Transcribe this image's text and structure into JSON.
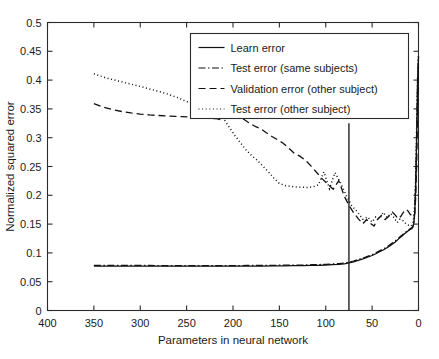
{
  "chart_data": {
    "type": "line",
    "title": "",
    "xlabel": "Parameters in neural network",
    "ylabel": "Normalized squared error",
    "xlim": [
      400,
      0
    ],
    "ylim": [
      0,
      0.5
    ],
    "x_reversed": true,
    "grid": false,
    "legend_position": "top-right",
    "xticks": [
      400,
      350,
      300,
      250,
      200,
      150,
      100,
      50,
      0
    ],
    "yticks": [
      0,
      0.05,
      0.1,
      0.15,
      0.2,
      0.25,
      0.3,
      0.35,
      0.4,
      0.45,
      0.5
    ],
    "xtick_labels": [
      "400",
      "350",
      "300",
      "250",
      "200",
      "150",
      "100",
      "50",
      "0"
    ],
    "ytick_labels": [
      "0",
      "0.05",
      "0.1",
      "0.15",
      "0.2",
      "0.25",
      "0.3",
      "0.35",
      "0.4",
      "0.45",
      "0.5"
    ],
    "annotations": [
      {
        "type": "vertical-line",
        "name": "selected-model-marker",
        "x": 75,
        "y_from": 0,
        "y_to": 0.325
      }
    ],
    "series": [
      {
        "name": "Learn error",
        "style": "solid",
        "x": [
          350,
          330,
          310,
          290,
          270,
          250,
          230,
          215,
          200,
          185,
          170,
          155,
          145,
          135,
          125,
          115,
          108,
          100,
          93,
          86,
          80,
          75,
          70,
          65,
          60,
          55,
          50,
          46,
          42,
          38,
          34,
          31,
          28,
          25,
          22,
          20,
          18,
          16,
          14,
          12,
          11,
          10,
          9,
          8,
          7,
          6,
          5,
          4,
          3,
          2,
          1,
          0
        ],
        "values": [
          0.077,
          0.077,
          0.077,
          0.077,
          0.077,
          0.077,
          0.077,
          0.077,
          0.077,
          0.0772,
          0.0772,
          0.0775,
          0.0775,
          0.078,
          0.078,
          0.0785,
          0.0785,
          0.079,
          0.0795,
          0.08,
          0.081,
          0.0825,
          0.0845,
          0.087,
          0.0895,
          0.0925,
          0.0955,
          0.0985,
          0.102,
          0.105,
          0.109,
          0.112,
          0.1155,
          0.119,
          0.1235,
          0.1265,
          0.129,
          0.132,
          0.1345,
          0.137,
          0.1385,
          0.1395,
          0.1405,
          0.1415,
          0.1425,
          0.145,
          0.152,
          0.17,
          0.22,
          0.3,
          0.395,
          0.44
        ]
      },
      {
        "name": "Test error (same subjects)",
        "style": "dashdot",
        "x": [
          350,
          330,
          310,
          290,
          270,
          250,
          230,
          215,
          200,
          185,
          170,
          155,
          145,
          135,
          125,
          115,
          108,
          100,
          93,
          86,
          80,
          75,
          70,
          65,
          60,
          55,
          50,
          46,
          42,
          38,
          34,
          31,
          28,
          25,
          22,
          20,
          18,
          16,
          14,
          12,
          11,
          10,
          9,
          8,
          7,
          6,
          5,
          4,
          3,
          2,
          1,
          0
        ],
        "values": [
          0.0785,
          0.0785,
          0.0782,
          0.0782,
          0.078,
          0.078,
          0.078,
          0.078,
          0.078,
          0.0782,
          0.0782,
          0.0785,
          0.0788,
          0.079,
          0.079,
          0.0795,
          0.0798,
          0.0802,
          0.0808,
          0.0815,
          0.0825,
          0.084,
          0.086,
          0.0885,
          0.091,
          0.094,
          0.097,
          0.1,
          0.1035,
          0.107,
          0.1105,
          0.114,
          0.1175,
          0.121,
          0.125,
          0.128,
          0.1305,
          0.1335,
          0.136,
          0.1385,
          0.14,
          0.141,
          0.142,
          0.143,
          0.144,
          0.1465,
          0.1535,
          0.172,
          0.222,
          0.302,
          0.397,
          0.442
        ]
      },
      {
        "name": "Validation error (other subject)",
        "style": "dashed",
        "x": [
          350,
          340,
          330,
          320,
          310,
          300,
          290,
          280,
          270,
          262,
          255,
          248,
          242,
          236,
          230,
          224,
          218,
          212,
          206,
          200,
          194,
          188,
          182,
          176,
          170,
          164,
          158,
          152,
          146,
          140,
          134,
          128,
          122,
          116,
          110,
          104,
          98,
          92,
          86,
          80,
          75,
          70,
          65,
          60,
          56,
          52,
          48,
          44,
          40,
          36,
          32,
          28,
          25,
          22,
          19,
          16,
          13,
          11,
          9,
          7,
          5,
          4,
          3,
          2,
          1,
          0
        ],
        "values": [
          0.359,
          0.353,
          0.349,
          0.3455,
          0.343,
          0.341,
          0.3395,
          0.3385,
          0.3375,
          0.337,
          0.3365,
          0.336,
          0.3355,
          0.3345,
          0.334,
          0.3335,
          0.333,
          0.3305,
          0.337,
          0.342,
          0.337,
          0.3315,
          0.325,
          0.3195,
          0.3155,
          0.3085,
          0.302,
          0.2965,
          0.2905,
          0.282,
          0.273,
          0.268,
          0.261,
          0.251,
          0.24,
          0.229,
          0.2195,
          0.2105,
          0.2255,
          0.1985,
          0.1825,
          0.17,
          0.1595,
          0.1505,
          0.158,
          0.1515,
          0.1465,
          0.1585,
          0.165,
          0.158,
          0.1635,
          0.1705,
          0.1655,
          0.1595,
          0.1635,
          0.171,
          0.1755,
          0.172,
          0.167,
          0.1645,
          0.163,
          0.1705,
          0.196,
          0.252,
          0.345,
          0.432
        ]
      },
      {
        "name": "Test error (other subject)",
        "style": "dotted",
        "x": [
          350,
          340,
          330,
          320,
          310,
          300,
          292,
          284,
          276,
          270,
          264,
          258,
          252,
          246,
          240,
          234,
          228,
          222,
          216,
          210,
          204,
          198,
          192,
          186,
          180,
          174,
          168,
          162,
          156,
          150,
          144,
          138,
          132,
          126,
          120,
          114,
          108,
          102,
          96,
          90,
          84,
          78,
          72,
          66,
          60,
          55,
          50,
          46,
          42,
          38,
          34,
          30,
          26,
          23,
          20,
          17,
          14,
          12,
          10,
          8,
          6,
          5,
          4,
          3,
          2,
          1,
          0
        ],
        "values": [
          0.411,
          0.4055,
          0.401,
          0.397,
          0.393,
          0.389,
          0.3855,
          0.382,
          0.3785,
          0.3755,
          0.372,
          0.3685,
          0.364,
          0.3605,
          0.357,
          0.3595,
          0.362,
          0.3565,
          0.345,
          0.3325,
          0.318,
          0.304,
          0.291,
          0.279,
          0.269,
          0.261,
          0.251,
          0.241,
          0.23,
          0.2205,
          0.217,
          0.2155,
          0.2145,
          0.214,
          0.2135,
          0.2145,
          0.218,
          0.2405,
          0.2115,
          0.2395,
          0.2215,
          0.2,
          0.182,
          0.1715,
          0.1585,
          0.1625,
          0.1535,
          0.1625,
          0.159,
          0.1705,
          0.1615,
          0.1685,
          0.1605,
          0.1525,
          0.1585,
          0.1565,
          0.1515,
          0.1485,
          0.148,
          0.1465,
          0.152,
          0.163,
          0.186,
          0.238,
          0.318,
          0.404,
          0.443
        ]
      }
    ]
  },
  "legend": {
    "entries": [
      {
        "label": "Learn error",
        "style": "solid"
      },
      {
        "label": "Test error (same subjects)",
        "style": "dashdot"
      },
      {
        "label": "Validation error (other subject)",
        "style": "dashed"
      },
      {
        "label": "Test error (other subject)",
        "style": "dotted"
      }
    ]
  }
}
